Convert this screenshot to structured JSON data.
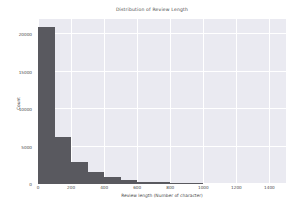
{
  "chart_data": {
    "type": "bar",
    "title": "Distribution of Review Length",
    "xlabel": "Review length (Number of character)",
    "ylabel": "Count",
    "xlim": [
      0,
      1500
    ],
    "ylim": [
      0,
      22000
    ],
    "grid": true,
    "legend": null,
    "bin_width": 100,
    "bin_edges": [
      0,
      100,
      200,
      300,
      400,
      500,
      600,
      700,
      800,
      900,
      1000,
      1100,
      1200,
      1300,
      1400,
      1500
    ],
    "x": [
      50,
      150,
      250,
      350,
      450,
      550,
      650,
      750,
      850,
      950,
      1050,
      1150,
      1250,
      1350,
      1450
    ],
    "values": [
      21000,
      6300,
      3000,
      1600,
      900,
      520,
      330,
      210,
      140,
      95,
      65,
      45,
      30,
      18,
      10
    ],
    "xticks": [
      0,
      200,
      400,
      600,
      800,
      1000,
      1200,
      1400
    ],
    "xticklabels": [
      "0",
      "200",
      "400",
      "600",
      "800",
      "1000",
      "1200",
      "1400"
    ],
    "yticks": [
      0,
      5000,
      10000,
      15000,
      20000
    ],
    "yticklabels": [
      "0",
      "5000",
      "10000",
      "15000",
      "20000"
    ],
    "colors": {
      "bar": "#59595f",
      "plot_background": "#eaeaf1",
      "figure_background": "#ffffff",
      "gridline": "#ffffff",
      "text": "#4a4a4a"
    }
  }
}
